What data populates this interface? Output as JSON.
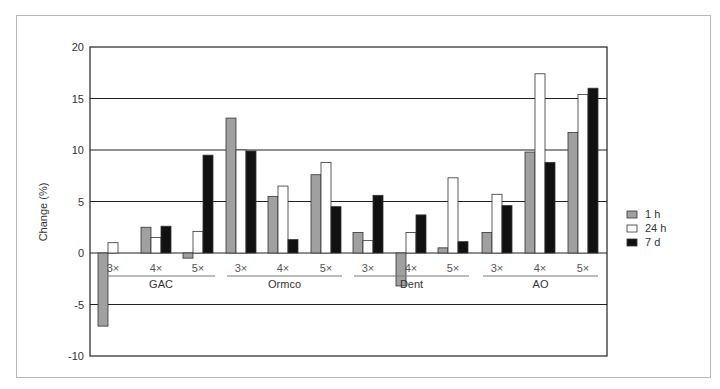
{
  "chart_data": {
    "type": "bar",
    "title": "",
    "xlabel": "",
    "ylabel": "Change (%)",
    "ylim": [
      -10,
      20
    ],
    "yticks": [
      20,
      15,
      10,
      5,
      0,
      -5,
      -10
    ],
    "grid": true,
    "legend_position": "right",
    "groups": [
      "GAC",
      "Ormco",
      "Dent",
      "AO"
    ],
    "subcategories": [
      "3×",
      "4×",
      "5×"
    ],
    "categories": [
      "GAC 3×",
      "GAC 4×",
      "GAC 5×",
      "Ormco 3×",
      "Ormco 4×",
      "Ormco 5×",
      "Dent 3×",
      "Dent 4×",
      "Dent 5×",
      "AO 3×",
      "AO 4×",
      "AO 5×"
    ],
    "series": [
      {
        "name": "1 h",
        "color": "#a0a0a0",
        "values": [
          -7.1,
          2.5,
          -0.5,
          13.1,
          5.5,
          7.6,
          2.0,
          -3.2,
          0.5,
          2.0,
          9.8,
          11.7
        ]
      },
      {
        "name": "24 h",
        "color": "#ffffff",
        "values": [
          1.0,
          1.5,
          2.1,
          10.0,
          6.5,
          8.8,
          1.2,
          2.0,
          7.3,
          5.7,
          17.4,
          15.4
        ]
      },
      {
        "name": "7 d",
        "color": "#111111",
        "values": [
          0.0,
          2.6,
          9.5,
          9.9,
          1.3,
          4.5,
          5.6,
          3.7,
          1.1,
          4.6,
          8.8,
          16.0
        ]
      }
    ]
  },
  "legend": [
    {
      "label": "1 h",
      "color": "#a0a0a0"
    },
    {
      "label": "24 h",
      "color": "#ffffff"
    },
    {
      "label": "7 d",
      "color": "#111111"
    }
  ]
}
